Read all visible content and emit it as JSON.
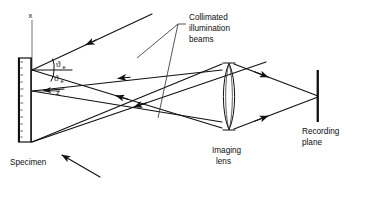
{
  "figure": {
    "background_color": "#ffffff",
    "ink_color": "#111111"
  },
  "labels": {
    "specimen": "Specimen",
    "collimated_line1": "Collimated",
    "collimated_line2": "illumination",
    "collimated_line3": "beams",
    "imaging_lens_line1": "Imaging",
    "imaging_lens_line2": "lens",
    "recording_line1": "Recording",
    "recording_line2": "plane",
    "axis_x": "x",
    "axis_z": "z",
    "angle_upper_symbol": "ϑ",
    "angle_upper_subscript": "e",
    "angle_lower_symbol": "ϑ",
    "angle_lower_subscript": "e"
  },
  "components": {
    "specimen_slab": "specimen-slab",
    "lens": "biconvex-imaging-lens",
    "recording_plane": "recording-plane-bar",
    "collimated_beam_1": "incoming-beam-upper",
    "collimated_beam_2": "incoming-beam-lower",
    "scattered_rays": "scattered-ray-bundle",
    "converging_rays": "converging-ray-bundle"
  }
}
